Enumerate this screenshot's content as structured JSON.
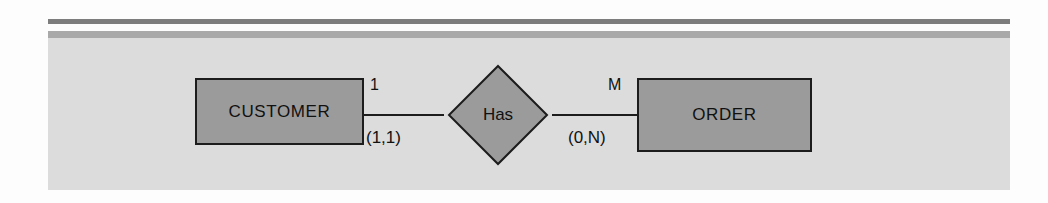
{
  "diagram": {
    "type": "entity-relationship-diagram",
    "notation": "Chen",
    "entities": [
      {
        "id": "customer",
        "label": "CUSTOMER"
      },
      {
        "id": "order",
        "label": "ORDER"
      }
    ],
    "relationship": {
      "id": "has",
      "label": "Has",
      "shape": "diamond"
    },
    "cardinalities": {
      "left_ratio": "1",
      "left_participation": "(1,1)",
      "right_ratio": "M",
      "right_participation": "(0,N)"
    },
    "colors": {
      "panel_background": "#dcdcdc",
      "shape_fill": "#9b9b9b",
      "shape_stroke": "#1c1c1c",
      "rule_dark": "#7d7d7d",
      "rule_light": "#a9a9a9"
    }
  }
}
